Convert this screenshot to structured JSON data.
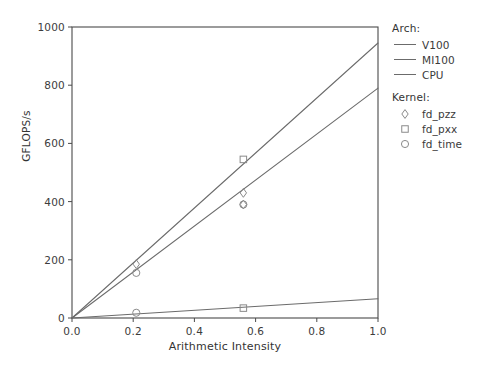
{
  "chart_data": {
    "type": "line",
    "title": "",
    "xlabel": "Arithmetic Intensity",
    "ylabel": "GFLOPS/s",
    "xlim": [
      0.0,
      1.0
    ],
    "ylim": [
      0,
      1000
    ],
    "xticks": [
      "0.0",
      "0.2",
      "0.4",
      "0.6",
      "0.8",
      "1.0"
    ],
    "xtick_values": [
      0.0,
      0.2,
      0.4,
      0.6,
      0.8,
      1.0
    ],
    "yticks": [
      "0",
      "200",
      "400",
      "600",
      "800",
      "1000"
    ],
    "ytick_values": [
      0,
      200,
      400,
      600,
      800,
      1000
    ],
    "grid": false,
    "legend_position": "right-outside",
    "series": [
      {
        "name": "V100",
        "kind": "roofline-line",
        "color": "#6b6b6b",
        "x": [
          0.0,
          1.0
        ],
        "values": [
          0,
          945
        ]
      },
      {
        "name": "MI100",
        "kind": "roofline-line",
        "color": "#6b6b6b",
        "x": [
          0.0,
          1.0
        ],
        "values": [
          0,
          790
        ]
      },
      {
        "name": "CPU",
        "kind": "roofline-line",
        "color": "#6b6b6b",
        "x": [
          0.0,
          1.0
        ],
        "values": [
          0,
          66
        ]
      }
    ],
    "points": [
      {
        "kernel": "fd_pzz",
        "arch": "V100",
        "marker": "diamond",
        "x": 0.21,
        "y": 185
      },
      {
        "kernel": "fd_time",
        "arch": "V100",
        "marker": "circle",
        "x": 0.21,
        "y": 155
      },
      {
        "kernel": "fd_pxx",
        "arch": "V100",
        "marker": "square",
        "x": 0.56,
        "y": 545
      },
      {
        "kernel": "fd_pzz",
        "arch": "MI100",
        "marker": "diamond",
        "x": 0.56,
        "y": 430
      },
      {
        "kernel": "fd_time",
        "arch": "MI100",
        "marker": "circle",
        "x": 0.56,
        "y": 390
      },
      {
        "kernel": "fd_pzz",
        "arch": "MI100",
        "marker": "diamond",
        "x": 0.56,
        "y": 390
      },
      {
        "kernel": "fd_time",
        "arch": "CPU",
        "marker": "circle",
        "x": 0.21,
        "y": 18
      },
      {
        "kernel": "fd_pxx",
        "arch": "CPU",
        "marker": "square",
        "x": 0.56,
        "y": 34
      }
    ]
  },
  "legend": {
    "arch": {
      "title": "Arch:",
      "items": [
        {
          "label": "V100"
        },
        {
          "label": "MI100"
        },
        {
          "label": "CPU"
        }
      ]
    },
    "kernel": {
      "title": "Kernel:",
      "items": [
        {
          "label": "fd_pzz",
          "marker": "diamond"
        },
        {
          "label": "fd_pxx",
          "marker": "square"
        },
        {
          "label": "fd_time",
          "marker": "circle"
        }
      ]
    }
  },
  "axes": {
    "xlabel": "Arithmetic Intensity",
    "ylabel": "GFLOPS/s"
  },
  "style": {
    "line_color": "#6b6b6b",
    "marker_color": "#8a8a8a",
    "axis_color": "#4a4a4a",
    "text_color": "#3a3a3a",
    "background": "#ffffff"
  }
}
